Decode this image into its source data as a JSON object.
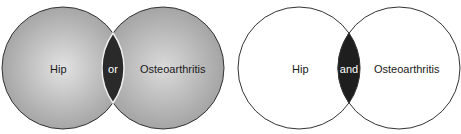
{
  "diagrams": [
    {
      "name": "union",
      "left_label": "Hip",
      "operator": "or",
      "right_label": "Osteoarthritis",
      "fill_color": "#a8a8a8",
      "highlight_color": "#dcdcdc",
      "intersection_color": "#2a2a2a"
    },
    {
      "name": "intersection",
      "left_label": "Hip",
      "operator": "and",
      "right_label": "Osteoarthritis",
      "fill_color": "#ffffff",
      "intersection_color": "#1e1e1e"
    }
  ]
}
